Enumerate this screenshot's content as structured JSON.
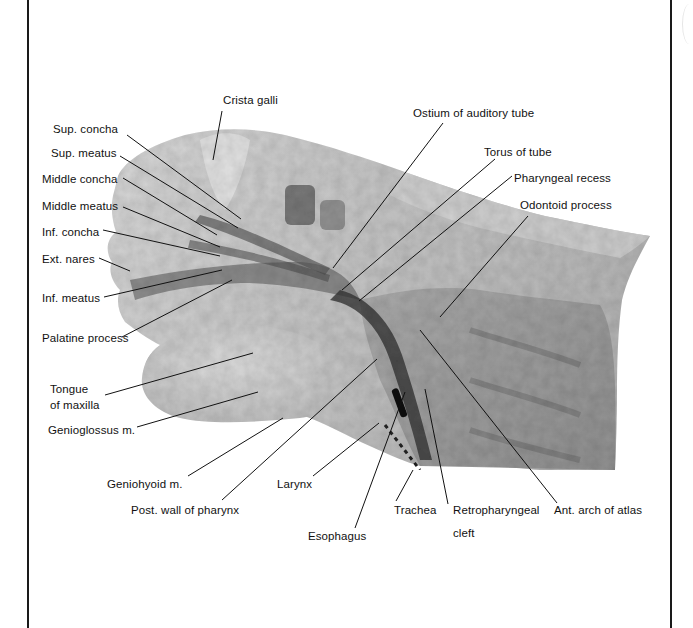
{
  "figure": {
    "type": "anatomical-illustration",
    "labels": [
      {
        "id": "crista-galli",
        "text": "Crista galli",
        "x": 223,
        "y": 93
      },
      {
        "id": "sup-concha",
        "text": "Sup. concha",
        "x": 53,
        "y": 122
      },
      {
        "id": "sup-meatus",
        "text": "Sup. meatus",
        "x": 51,
        "y": 146
      },
      {
        "id": "middle-concha",
        "text": "Middle concha",
        "x": 42,
        "y": 174
      },
      {
        "id": "middle-meatus",
        "text": "Middle meatus",
        "x": 42,
        "y": 200
      },
      {
        "id": "inf-concha",
        "text": "Inf. concha",
        "x": 42,
        "y": 226
      },
      {
        "id": "ext-nares",
        "text": "Ext. nares",
        "x": 42,
        "y": 253
      },
      {
        "id": "inf-meatus",
        "text": "Inf. meatus",
        "x": 42,
        "y": 292
      },
      {
        "id": "palatine-process",
        "text": "Palatine process",
        "x": 42,
        "y": 332
      },
      {
        "id": "tongue",
        "text": "Tongue",
        "x": 50,
        "y": 383
      },
      {
        "id": "of-maxilla",
        "text": "of maxilla",
        "x": 50,
        "y": 399
      },
      {
        "id": "genioglossus",
        "text": "Genioglossus m.",
        "x": 48,
        "y": 425
      },
      {
        "id": "ostium-auditory-tube",
        "text": "Ostium of auditory tube",
        "x": 413,
        "y": 106
      },
      {
        "id": "torus-of-tube",
        "text": "Torus of tube",
        "x": 484,
        "y": 145
      },
      {
        "id": "pharyngeal-recess",
        "text": "Pharyngeal recess",
        "x": 514,
        "y": 171
      },
      {
        "id": "odontoid-process",
        "text": "Odontoid process",
        "x": 520,
        "y": 198
      },
      {
        "id": "geniohyoid",
        "text": "Geniohyoid m.",
        "x": 107,
        "y": 477
      },
      {
        "id": "larynx",
        "text": "Larynx",
        "x": 277,
        "y": 477
      },
      {
        "id": "post-wall-pharynx",
        "text": "Post. wall of pharynx",
        "x": 131,
        "y": 503
      },
      {
        "id": "esophagus",
        "text": "Esophagus",
        "x": 308,
        "y": 529
      },
      {
        "id": "trachea",
        "text": "Trachea",
        "x": 394,
        "y": 503
      },
      {
        "id": "retropharyngeal",
        "text": "Retropharyngeal",
        "x": 453,
        "y": 503
      },
      {
        "id": "cleft",
        "text": "cleft",
        "x": 453,
        "y": 526
      },
      {
        "id": "ant-arch-atlas",
        "text": "Ant. arch of atlas",
        "x": 554,
        "y": 503
      }
    ],
    "leader_lines": [
      {
        "label": "crista-galli",
        "x1": 222,
        "y1": 111,
        "x2": 213,
        "y2": 160
      },
      {
        "label": "sup-concha",
        "x1": 127,
        "y1": 135,
        "x2": 241,
        "y2": 219
      },
      {
        "label": "sup-meatus",
        "x1": 120,
        "y1": 156,
        "x2": 238,
        "y2": 228
      },
      {
        "label": "middle-concha",
        "x1": 123,
        "y1": 178,
        "x2": 217,
        "y2": 235
      },
      {
        "label": "middle-meatus",
        "x1": 123,
        "y1": 207,
        "x2": 220,
        "y2": 247
      },
      {
        "label": "inf-concha",
        "x1": 103,
        "y1": 230,
        "x2": 220,
        "y2": 256
      },
      {
        "label": "ext-nares",
        "x1": 99,
        "y1": 258,
        "x2": 130,
        "y2": 271
      },
      {
        "label": "inf-meatus",
        "x1": 104,
        "y1": 297,
        "x2": 222,
        "y2": 270
      },
      {
        "label": "palatine-process",
        "x1": 122,
        "y1": 337,
        "x2": 232,
        "y2": 280
      },
      {
        "label": "tongue",
        "x1": 105,
        "y1": 395,
        "x2": 253,
        "y2": 353
      },
      {
        "label": "genioglossus",
        "x1": 137,
        "y1": 427,
        "x2": 258,
        "y2": 392
      },
      {
        "label": "ostium-auditory-tube",
        "x1": 443,
        "y1": 123,
        "x2": 333,
        "y2": 268
      },
      {
        "label": "torus-of-tube",
        "x1": 495,
        "y1": 159,
        "x2": 342,
        "y2": 290
      },
      {
        "label": "pharyngeal-recess",
        "x1": 512,
        "y1": 176,
        "x2": 359,
        "y2": 301
      },
      {
        "label": "odontoid-process",
        "x1": 528,
        "y1": 216,
        "x2": 440,
        "y2": 317
      },
      {
        "label": "geniohyoid",
        "x1": 188,
        "y1": 476,
        "x2": 283,
        "y2": 418
      },
      {
        "label": "post-wall-pharynx",
        "x1": 222,
        "y1": 500,
        "x2": 377,
        "y2": 359
      },
      {
        "label": "larynx",
        "x1": 313,
        "y1": 476,
        "x2": 379,
        "y2": 423
      },
      {
        "label": "esophagus",
        "x1": 355,
        "y1": 528,
        "x2": 405,
        "y2": 392
      },
      {
        "label": "trachea",
        "x1": 396,
        "y1": 501,
        "x2": 413,
        "y2": 470
      },
      {
        "label": "retropharyngeal",
        "x1": 448,
        "y1": 504,
        "x2": 425,
        "y2": 389
      },
      {
        "label": "ant-arch-atlas",
        "x1": 557,
        "y1": 503,
        "x2": 420,
        "y2": 330
      }
    ]
  }
}
